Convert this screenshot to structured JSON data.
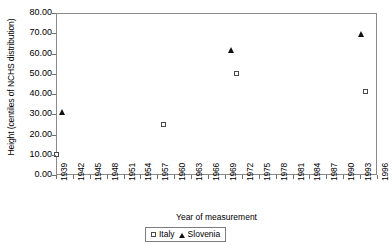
{
  "chart_data": {
    "type": "scatter",
    "title": "",
    "xlabel": "Year of measurement",
    "ylabel": "Height (centiles of NCHS distribution)",
    "xlim": [
      1939,
      1996
    ],
    "ylim": [
      0.0,
      80.0
    ],
    "grid": false,
    "legend_position": "bottom-center",
    "xticks": [
      "1939",
      "1942",
      "1945",
      "1948",
      "1951",
      "1954",
      "1957",
      "1960",
      "1963",
      "1966",
      "1969",
      "1972",
      "1975",
      "1978",
      "1981",
      "1984",
      "1987",
      "1990",
      "1993",
      "1996"
    ],
    "yticks": [
      "0.00",
      "10.00",
      "20.00",
      "30.00",
      "40.00",
      "50.00",
      "60.00",
      "70.00",
      "80.00"
    ],
    "series": [
      {
        "name": "Italy",
        "marker": "open-square",
        "color": "#4a4a4a",
        "points": [
          {
            "x": 1939,
            "y": 10.0
          },
          {
            "x": 1958,
            "y": 25.0
          },
          {
            "x": 1971,
            "y": 50.0
          },
          {
            "x": 1994,
            "y": 41.0
          }
        ]
      },
      {
        "name": "Slovenia",
        "marker": "filled-triangle",
        "color": "#111111",
        "points": [
          {
            "x": 1940,
            "y": 31.5
          },
          {
            "x": 1970,
            "y": 62.0
          },
          {
            "x": 1993,
            "y": 70.0
          }
        ]
      }
    ]
  },
  "legend": {
    "italy_label": "Italy",
    "slovenia_label": "Slovenia"
  }
}
